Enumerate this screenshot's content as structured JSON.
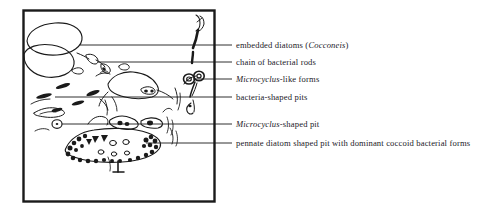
{
  "figure": {
    "type": "scientific-line-drawing",
    "background_color": "#ffffff",
    "ink_color": "#1a1a1a",
    "frame": {
      "border_color": "#1a1a1a",
      "x": 23,
      "y": 10,
      "width": 192,
      "height": 192
    }
  },
  "labels": [
    {
      "id": "embedded-diatoms",
      "pre": "embedded diatoms (",
      "italic": "Cocconeis",
      "post": ")",
      "leader": {
        "x1": 80,
        "y1": 45,
        "x2": 232,
        "y2": 45
      },
      "text_x": 236,
      "text_y": 40
    },
    {
      "id": "chain-of-bacterial-rods",
      "pre": "chain of bacterial rods",
      "italic": "",
      "post": "",
      "leader": {
        "x1": 98,
        "y1": 62,
        "x2": 232,
        "y2": 62
      },
      "text_x": 236,
      "text_y": 57
    },
    {
      "id": "microcyclus-like-forms",
      "pre": "",
      "italic": "Microcyclus",
      "post": "-like forms",
      "leader": {
        "x1": 193,
        "y1": 79,
        "x2": 232,
        "y2": 79
      },
      "text_x": 236,
      "text_y": 74
    },
    {
      "id": "bacteria-shaped-pits",
      "pre": "bacteria-shaped pits",
      "italic": "",
      "post": "",
      "leader": {
        "x1": 55,
        "y1": 97,
        "x2": 232,
        "y2": 97
      },
      "text_x": 236,
      "text_y": 92
    },
    {
      "id": "microcyclus-shaped-pit",
      "pre": "",
      "italic": "Microcyclus",
      "post": "-shaped pit",
      "leader": {
        "x1": 62,
        "y1": 124,
        "x2": 232,
        "y2": 124
      },
      "text_x": 236,
      "text_y": 119
    },
    {
      "id": "pennate-diatom-shaped-pit",
      "pre": "pennate diatom shaped pit with dominant coccoid bacterial forms",
      "italic": "",
      "post": "",
      "leader": {
        "x1": 146,
        "y1": 143,
        "x2": 232,
        "y2": 143
      },
      "text_x": 236,
      "text_y": 138
    }
  ]
}
